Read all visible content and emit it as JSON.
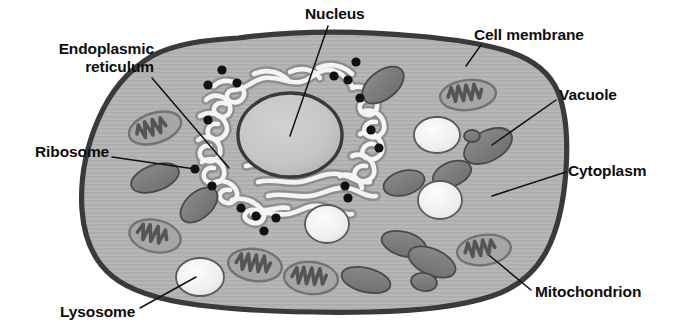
{
  "diagram": {
    "labels": [
      {
        "id": "nucleus",
        "text": "Nucleus",
        "x": 305,
        "y": 5,
        "align": "left"
      },
      {
        "id": "cell-membrane",
        "text": "Cell membrane",
        "x": 474,
        "y": 26,
        "align": "left"
      },
      {
        "id": "endoplasmic-reticulum",
        "text": "Endoplasmic\nreticulum",
        "x": 36,
        "y": 40,
        "align": "right",
        "w": 118
      },
      {
        "id": "vacuole",
        "text": "Vacuole",
        "x": 559,
        "y": 86,
        "align": "left"
      },
      {
        "id": "ribosome",
        "text": "Ribosome",
        "x": 35,
        "y": 143,
        "align": "left"
      },
      {
        "id": "cytoplasm",
        "text": "Cytoplasm",
        "x": 568,
        "y": 162,
        "align": "left"
      },
      {
        "id": "lysosome",
        "text": "Lysosome",
        "x": 60,
        "y": 303,
        "align": "left"
      },
      {
        "id": "mitochondrion",
        "text": "Mitochondrion",
        "x": 535,
        "y": 283,
        "align": "left"
      }
    ],
    "leader_lines": [
      {
        "id": "leader-nucleus",
        "points": "328,26 290,136"
      },
      {
        "id": "leader-cell-membrane",
        "points": "481,45 466,66"
      },
      {
        "id": "leader-endoplasmic-reticulum",
        "points": "152,78 229,168"
      },
      {
        "id": "leader-vacuole",
        "points": "556,100 492,145"
      },
      {
        "id": "leader-ribosome",
        "points": "112,157 195,169"
      },
      {
        "id": "leader-cytoplasm",
        "points": "566,172 492,196"
      },
      {
        "id": "leader-lysosome",
        "points": "140,308 196,277"
      },
      {
        "id": "leader-mitochondrion",
        "points": "531,290 490,256"
      }
    ],
    "colors": {
      "background": "#ffffff",
      "cell_membrane": "#3b3b3b",
      "cytoplasm": "#b4b4b4",
      "nucleus_fill": "#c3c3c3",
      "nucleus_outline": "#3a3a3a",
      "er_tubule": "#f2f2f2",
      "er_outline": "#8e8e8e",
      "ribosome": "#111111",
      "vacuole_fill": "#7e7e7e",
      "vacuole_outline": "#4a4a4a",
      "lysosome_fill": "#ececec",
      "lysosome_outline": "#5a5a5a",
      "mitochondrion_fill": "#a0a0a0",
      "mitochondrion_outline": "#6e6e6e",
      "mitochondrion_cristae": "#545454",
      "label_text": "#0d0d0d",
      "leader_line": "#111111"
    },
    "organelles": {
      "nucleus": {
        "cx": 290,
        "cy": 135,
        "rx": 52,
        "ry": 42
      },
      "ribosomes": [
        {
          "cx": 222,
          "cy": 70,
          "r": 4.6
        },
        {
          "cx": 237,
          "cy": 83,
          "r": 4.6
        },
        {
          "cx": 208,
          "cy": 85,
          "r": 4.6
        },
        {
          "cx": 208,
          "cy": 120,
          "r": 4.6
        },
        {
          "cx": 195,
          "cy": 169,
          "r": 4.6
        },
        {
          "cx": 212,
          "cy": 186,
          "r": 4.6
        },
        {
          "cx": 241,
          "cy": 208,
          "r": 4.6
        },
        {
          "cx": 253,
          "cy": 214,
          "r": 4.6
        },
        {
          "cx": 274,
          "cy": 216,
          "r": 4.6
        },
        {
          "cx": 262,
          "cy": 229,
          "r": 4.6
        },
        {
          "cx": 356,
          "cy": 62,
          "r": 4.6
        },
        {
          "cx": 334,
          "cy": 76,
          "r": 4.6
        },
        {
          "cx": 347,
          "cy": 80,
          "r": 4.6
        },
        {
          "cx": 359,
          "cy": 98,
          "r": 4.6
        },
        {
          "cx": 371,
          "cy": 130,
          "r": 4.6
        },
        {
          "cx": 378,
          "cy": 148,
          "r": 4.6
        },
        {
          "cx": 345,
          "cy": 186,
          "r": 4.6
        },
        {
          "cx": 345,
          "cy": 196,
          "r": 4.6
        }
      ],
      "vacuoles": [
        {
          "cx": 383,
          "cy": 85,
          "rx": 24,
          "ry": 14,
          "rot": -38
        },
        {
          "cx": 488,
          "cy": 146,
          "rx": 26,
          "ry": 15,
          "rot": -28
        },
        {
          "cx": 452,
          "cy": 174,
          "rx": 20,
          "ry": 12,
          "rot": -22
        },
        {
          "cx": 404,
          "cy": 183,
          "rx": 21,
          "ry": 12,
          "rot": -16
        },
        {
          "cx": 155,
          "cy": 178,
          "rx": 25,
          "ry": 13,
          "rot": -20
        },
        {
          "cx": 199,
          "cy": 205,
          "rx": 22,
          "ry": 13,
          "rot": -42
        },
        {
          "cx": 404,
          "cy": 244,
          "rx": 23,
          "ry": 12,
          "rot": 16
        },
        {
          "cx": 418,
          "cy": 266,
          "rx": 25,
          "ry": 13,
          "rot": 22
        },
        {
          "cx": 419,
          "cy": 268,
          "rx": 12,
          "ry": 9,
          "rot": 0
        },
        {
          "cx": 372,
          "cy": 276,
          "rx": 11,
          "ry": 8,
          "rot": 0
        },
        {
          "cx": 329,
          "cy": 268,
          "rx": 24,
          "ry": 12,
          "rot": 18
        }
      ],
      "lysosomes": [
        {
          "cx": 437,
          "cy": 135,
          "rx": 23,
          "ry": 18,
          "rot": 0
        },
        {
          "cx": 440,
          "cy": 200,
          "rx": 22,
          "ry": 19,
          "rot": 0
        },
        {
          "cx": 327,
          "cy": 224,
          "rx": 22,
          "ry": 19,
          "rot": 0
        },
        {
          "cx": 200,
          "cy": 277,
          "rx": 24,
          "ry": 19,
          "rot": 0
        }
      ],
      "mitochondria": [
        {
          "cx": 155,
          "cy": 128,
          "rx": 27,
          "ry": 15,
          "rot": -18
        },
        {
          "cx": 155,
          "cy": 236,
          "rx": 26,
          "ry": 16,
          "rot": 12
        },
        {
          "cx": 255,
          "cy": 265,
          "rx": 27,
          "ry": 16,
          "rot": 8
        },
        {
          "cx": 311,
          "cy": 278,
          "rx": 27,
          "ry": 16,
          "rot": 6
        },
        {
          "cx": 468,
          "cy": 95,
          "rx": 28,
          "ry": 15,
          "rot": -6
        },
        {
          "cx": 484,
          "cy": 250,
          "rx": 27,
          "ry": 15,
          "rot": -8
        }
      ]
    }
  }
}
